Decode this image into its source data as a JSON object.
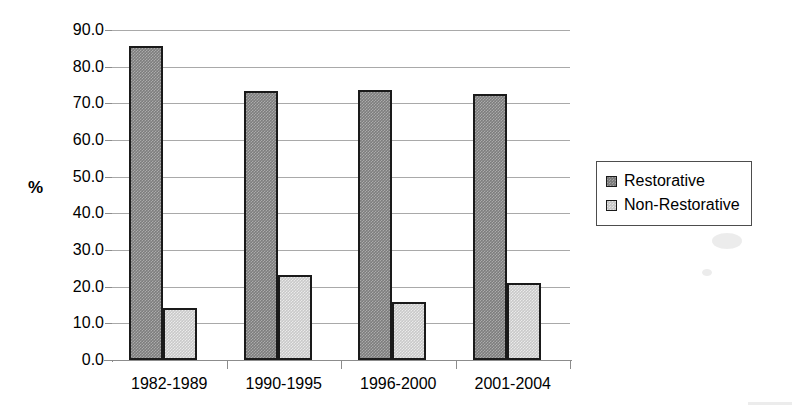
{
  "chart_data": {
    "type": "bar",
    "title": "",
    "subtitle": "",
    "xlabel": "",
    "ylabel": "%",
    "ylim": [
      0,
      90
    ],
    "ytick_step": 10,
    "ytick_labels": [
      "0.0",
      "10.0",
      "20.0",
      "30.0",
      "40.0",
      "50.0",
      "60.0",
      "70.0",
      "80.0",
      "90.0"
    ],
    "grid": true,
    "legend_position": "right",
    "categories": [
      "1982-1989",
      "1990-1995",
      "1996-2000",
      "2001-2004"
    ],
    "series": [
      {
        "name": "Restorative",
        "color": "#7d7d7d",
        "values": [
          85.7,
          73.5,
          73.6,
          72.6
        ]
      },
      {
        "name": "Non-Restorative",
        "color": "#c9c9c9",
        "values": [
          14.3,
          23.2,
          15.9,
          21.0
        ]
      }
    ]
  },
  "legend": {
    "entries": [
      {
        "label": "Restorative"
      },
      {
        "label": "Non-Restorative"
      }
    ]
  },
  "colors": {
    "series_restorative": "#7d7d7d",
    "series_non_restorative": "#c9c9c9",
    "gridline": "#a9a9a9",
    "axis": "#8c8c8c",
    "bar_border": "#1a1a1a",
    "background": "#ffffff"
  }
}
